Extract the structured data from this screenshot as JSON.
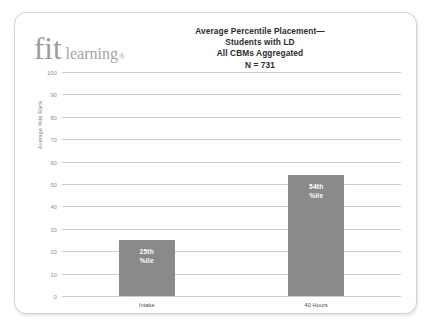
{
  "logo": {
    "word_mark": "fit",
    "sub_mark": "learning",
    "registered": "®"
  },
  "chart_data": {
    "type": "bar",
    "title": "Average Percentile Placement—\nStudents with LD\nAll CBMs Aggregated\nN = 731",
    "title_lines": [
      "Average Percentile Placement—",
      "Students with LD",
      "All CBMs Aggregated",
      "N = 731"
    ],
    "categories": [
      "Intake",
      "40 Hours"
    ],
    "values": [
      25,
      54
    ],
    "data_labels": [
      "25th\n%ile",
      "54th\n%ile"
    ],
    "data_label_lines": [
      [
        "25th",
        "%ile"
      ],
      [
        "54th",
        "%ile"
      ]
    ],
    "xlabel": "",
    "ylabel": "Average %ile Rank",
    "ylim": [
      0,
      100
    ],
    "yticks": [
      100,
      90,
      80,
      70,
      60,
      50,
      40,
      30,
      20,
      10,
      0
    ],
    "grid": true,
    "legend": false,
    "bar_color": "#8a8a8a",
    "grid_color": "#c9cdd4",
    "data_label_color": "#ffffff",
    "sample_size": "N = 731"
  }
}
